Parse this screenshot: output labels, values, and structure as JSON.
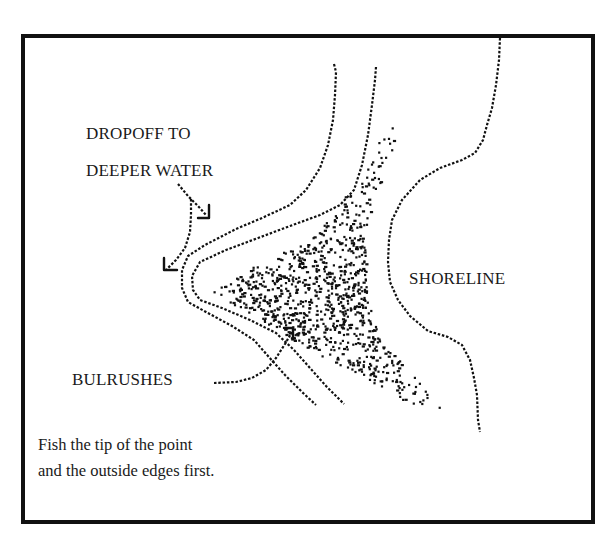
{
  "diagram": {
    "labels": {
      "dropoff_line1": "DROPOFF TO",
      "dropoff_line2": "DEEPER WATER",
      "shoreline": "SHORELINE",
      "bulrushes": "BULRUSHES"
    },
    "caption": {
      "line1": "Fish the tip of the point",
      "line2": "and the outside edges first."
    },
    "colors": {
      "ink": "#111111",
      "background": "#ffffff"
    },
    "elements": [
      {
        "id": "outer-dropoff-contour",
        "type": "line"
      },
      {
        "id": "inner-dropoff-contour",
        "type": "line"
      },
      {
        "id": "shoreline",
        "type": "line"
      },
      {
        "id": "bulrushes-stipple",
        "type": "stipple"
      },
      {
        "id": "dropoff-arrow-1",
        "type": "arrow"
      },
      {
        "id": "dropoff-arrow-2",
        "type": "arrow"
      },
      {
        "id": "bulrushes-arrow",
        "type": "arrow"
      }
    ]
  }
}
